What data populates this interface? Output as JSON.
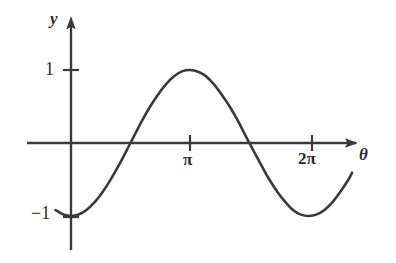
{
  "figure": {
    "background_color": "#ffffff",
    "ink_color": "#3a3a3a",
    "text_color": "#2b2b2b"
  },
  "axes": {
    "y_axis_label": "y",
    "x_axis_label": "θ",
    "origin_px": {
      "x": 71,
      "y": 143
    },
    "x_axis_start_px": 27,
    "x_axis_end_px": 358,
    "y_axis_top_px": 18,
    "y_axis_bottom_px": 250,
    "unit_y_px": 73,
    "pi_px": 119
  },
  "y_ticks": [
    {
      "label": "1",
      "value": 1,
      "y_px": 70
    },
    {
      "label": "−1",
      "value": -1,
      "y_px": 217
    }
  ],
  "x_ticks": [
    {
      "label": "π",
      "value": 3.14159,
      "x_px": 190
    },
    {
      "label": "2π",
      "value": 6.28319,
      "x_px": 312
    }
  ],
  "chart_data": {
    "type": "line",
    "title": "",
    "xlabel": "θ",
    "ylabel": "y",
    "grid": false,
    "legend": "none",
    "xlim": [
      -0.41,
      7.42
    ],
    "ylim": [
      -1.0,
      1.0
    ],
    "xticks": [
      3.14159,
      6.28319
    ],
    "xticklabels": [
      "π",
      "2π"
    ],
    "yticks": [
      -1,
      1
    ],
    "yticklabels": [
      "−1",
      "1"
    ],
    "series": [
      {
        "name": "y = −cos θ",
        "equation": "y = -cos(theta)",
        "x": [
          -0.41,
          -0.2,
          0.0,
          0.2,
          0.41,
          0.63,
          0.84,
          1.05,
          1.26,
          1.47,
          1.57,
          1.68,
          1.88,
          2.09,
          2.3,
          2.51,
          2.72,
          2.93,
          3.14159,
          3.36,
          3.56,
          3.77,
          3.98,
          4.19,
          4.4,
          4.61,
          4.71,
          4.82,
          5.03,
          5.24,
          5.45,
          5.65,
          5.86,
          6.07,
          6.28319,
          6.49,
          6.7,
          6.91,
          7.12,
          7.33,
          7.42
        ],
        "y": [
          -0.918,
          -0.98,
          -1.0,
          -0.98,
          -0.918,
          -0.808,
          -0.667,
          -0.498,
          -0.307,
          -0.101,
          0.0,
          0.11,
          0.309,
          0.5,
          0.666,
          0.806,
          0.914,
          0.981,
          1.0,
          0.977,
          0.916,
          0.806,
          0.661,
          0.5,
          0.31,
          0.098,
          0.0,
          -0.108,
          -0.309,
          -0.503,
          -0.67,
          -0.803,
          -0.918,
          -0.981,
          -1.0,
          -0.978,
          -0.914,
          -0.806,
          -0.661,
          -0.497,
          -0.406
        ]
      }
    ],
    "zero_crossings_px": [
      129,
      253
    ],
    "maximum": {
      "x": 3.14159,
      "y": 1
    },
    "minima": [
      {
        "x": 0,
        "y": -1
      },
      {
        "x": 6.28319,
        "y": -1
      }
    ]
  }
}
